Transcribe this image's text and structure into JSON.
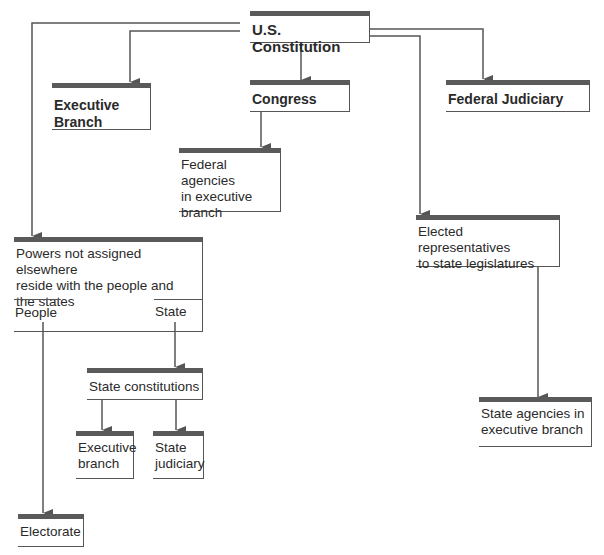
{
  "diagram": {
    "title": "U.S. Constitution",
    "type": "organizational flow diagram",
    "nodes": {
      "constitution": {
        "label": "U.S. Constitution"
      },
      "executive_branch": {
        "label": "Executive\nBranch"
      },
      "congress": {
        "label": "Congress"
      },
      "federal_judiciary": {
        "label": "Federal Judiciary"
      },
      "federal_agencies": {
        "label": "Federal agencies\nin executive\nbranch"
      },
      "powers": {
        "label": "Powers not assigned elsewhere\nreside with the people and\nthe states",
        "left_section": "People",
        "right_section": "State"
      },
      "elected_reps": {
        "label": "Elected representatives\nto state legislatures"
      },
      "state_constitutions": {
        "label": "State constitutions"
      },
      "state_executive": {
        "label": "Executive\nbranch"
      },
      "state_judiciary": {
        "label": "State\njudiciary"
      },
      "state_agencies": {
        "label": "State agencies in\nexecutive branch"
      },
      "electorate": {
        "label": "Electorate"
      }
    },
    "edges": [
      {
        "from": "U.S. Constitution",
        "to": "Executive Branch"
      },
      {
        "from": "U.S. Constitution",
        "to": "Congress"
      },
      {
        "from": "U.S. Constitution",
        "to": "Federal Judiciary"
      },
      {
        "from": "U.S. Constitution",
        "to": "Powers not assigned elsewhere reside with the people and the states"
      },
      {
        "from": "U.S. Constitution",
        "to": "Elected representatives to state legislatures"
      },
      {
        "from": "Congress",
        "to": "Federal agencies in executive branch"
      },
      {
        "from": "State",
        "to": "State constitutions"
      },
      {
        "from": "People",
        "to": "Electorate"
      },
      {
        "from": "State constitutions",
        "to": "Executive branch"
      },
      {
        "from": "State constitutions",
        "to": "State judiciary"
      },
      {
        "from": "Elected representatives to state legislatures",
        "to": "State agencies in executive branch"
      }
    ],
    "colors": {
      "line": "#555555",
      "header_bar": "#5a5a5a",
      "text": "#2a2a2a",
      "background": "#ffffff"
    }
  }
}
